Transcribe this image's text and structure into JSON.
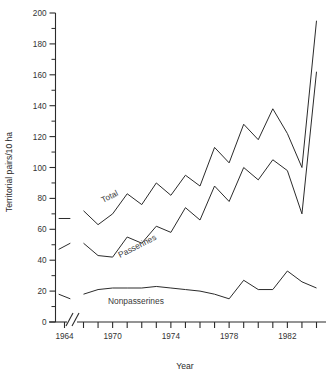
{
  "chart_data": {
    "type": "line",
    "title": "",
    "xlabel": "Year",
    "ylabel": "Territorial pairs/10 ha",
    "ylim": [
      0,
      200
    ],
    "y_major_ticks": [
      0,
      20,
      40,
      60,
      80,
      100,
      120,
      140,
      160,
      180,
      200
    ],
    "y_minor_ticks": [
      10,
      30,
      50,
      70,
      90,
      110,
      130,
      150,
      170,
      190
    ],
    "y_tick_labels": [
      "0",
      "20",
      "40",
      "60",
      "80",
      "100",
      "120",
      "140",
      "160",
      "180",
      "200"
    ],
    "x_tick_labels": [
      "1964",
      "1970",
      "1974",
      "1978",
      "1982"
    ],
    "x_labeled_years": [
      1964,
      1970,
      1974,
      1978,
      1982
    ],
    "x_tick_years": [
      1964,
      1968,
      1969,
      1970,
      1971,
      1972,
      1973,
      1974,
      1975,
      1976,
      1977,
      1978,
      1979,
      1980,
      1981,
      1982,
      1983,
      1984
    ],
    "axis_break": true,
    "axis_break_between": [
      1964,
      1968
    ],
    "grid": false,
    "legend": "inline-labels",
    "series": [
      {
        "name": "Total",
        "label": "Total",
        "x": [
          1963.6,
          1964.4
        ],
        "values": [
          67,
          67
        ],
        "segment": "pre-break"
      },
      {
        "name": "Total",
        "label": "Total",
        "x": [
          1968,
          1969,
          1970,
          1971,
          1972,
          1973,
          1974,
          1975,
          1976,
          1977,
          1978,
          1979,
          1980,
          1981,
          1982,
          1983,
          1984
        ],
        "values": [
          72,
          63,
          70,
          83,
          76,
          90,
          82,
          95,
          88,
          113,
          103,
          128,
          118,
          138,
          122,
          100,
          195
        ],
        "segment": "main"
      },
      {
        "name": "Passerines",
        "label": "Passerines",
        "x": [
          1963.6,
          1964.4
        ],
        "values": [
          47,
          51
        ],
        "segment": "pre-break"
      },
      {
        "name": "Passerines",
        "label": "Passerines",
        "x": [
          1968,
          1969,
          1970,
          1971,
          1972,
          1973,
          1974,
          1975,
          1976,
          1977,
          1978,
          1979,
          1980,
          1981,
          1982,
          1983,
          1984
        ],
        "values": [
          51,
          43,
          42,
          55,
          51,
          62,
          58,
          74,
          66,
          88,
          78,
          100,
          92,
          105,
          98,
          70,
          162
        ],
        "segment": "main"
      },
      {
        "name": "Nonpasserines",
        "label": "Nonpasserines",
        "x": [
          1963.6,
          1964.4
        ],
        "values": [
          18,
          15
        ],
        "segment": "pre-break"
      },
      {
        "name": "Nonpasserines",
        "label": "Nonpasserines",
        "x": [
          1968,
          1969,
          1970,
          1971,
          1972,
          1973,
          1974,
          1975,
          1976,
          1977,
          1978,
          1979,
          1980,
          1981,
          1982,
          1983,
          1984
        ],
        "values": [
          18,
          21,
          22,
          22,
          22,
          23,
          22,
          21,
          20,
          18,
          15,
          27,
          21,
          21,
          33,
          26,
          22
        ],
        "segment": "main"
      }
    ],
    "series_label_positions": [
      {
        "label": "Total",
        "x": 103,
        "y": 203,
        "rotate": -27
      },
      {
        "label": "Passerines",
        "x": 120,
        "y": 258,
        "rotate": -27
      },
      {
        "label": "Nonpasserines",
        "x": 108,
        "y": 304,
        "rotate": 0
      }
    ],
    "annotations": [
      "Total peaks near 195 in 1983 and ends near 193 in 1984",
      "Passerines ends near 171",
      "Nonpasserines stays between 15 and 33"
    ],
    "colors": {
      "line": "#2b2b2b",
      "axis": "#2b2b2b",
      "background": "#ffffff",
      "label": "#3a3a3a"
    }
  }
}
